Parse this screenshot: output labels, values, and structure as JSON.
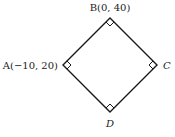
{
  "diagram": {
    "shape": "square",
    "vertices": {
      "A": {
        "label": "A(−10, 20)",
        "x": 63,
        "y": 65
      },
      "B": {
        "label": "B(0, 40)",
        "x": 110,
        "y": 18
      },
      "C": {
        "label": "C",
        "x": 157,
        "y": 65
      },
      "D": {
        "label": "D",
        "x": 110,
        "y": 112
      }
    },
    "right_angle_markers": [
      "A",
      "B",
      "C",
      "D"
    ],
    "stroke_color": "#1a1a1a"
  }
}
